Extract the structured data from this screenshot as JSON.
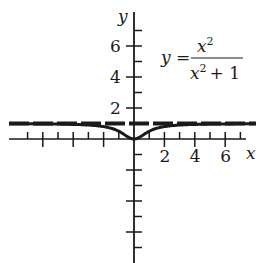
{
  "chart_data": {
    "type": "line",
    "title": "",
    "equation": {
      "lhs": "y =",
      "numerator": "x",
      "numerator_exp": "2",
      "denominator": "x",
      "denominator_exp": "2",
      "denominator_rest": "+ 1"
    },
    "xlabel": "x",
    "ylabel": "y",
    "xlim": [
      -8.3,
      8
    ],
    "ylim": [
      -8,
      8
    ],
    "x_tick_labels": [
      "2",
      "4",
      "6"
    ],
    "x_tick_values": [
      2,
      4,
      6
    ],
    "y_tick_labels": [
      "6",
      "4",
      "2"
    ],
    "y_tick_values": [
      6,
      4,
      2
    ],
    "grid": false,
    "series": [
      {
        "name": "y = x^2/(x^2+1)",
        "style": "solid",
        "x": [
          -8,
          -6,
          -4,
          -3,
          -2,
          -1.5,
          -1,
          -0.5,
          0,
          0.5,
          1,
          1.5,
          2,
          3,
          4,
          6,
          8
        ],
        "y": [
          0.985,
          0.973,
          0.941,
          0.9,
          0.8,
          0.692,
          0.5,
          0.2,
          0,
          0.2,
          0.5,
          0.692,
          0.8,
          0.9,
          0.941,
          0.973,
          0.985
        ]
      },
      {
        "name": "asymptote y = 1",
        "style": "dashed",
        "x": [
          -8.3,
          8
        ],
        "y": [
          1,
          1
        ]
      }
    ],
    "colors": {
      "ink": "#1a1a1a",
      "background": "#ffffff"
    }
  }
}
